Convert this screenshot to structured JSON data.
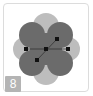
{
  "thumbnail": {
    "badge_number": "8",
    "shape_icon": "quatrefoil-shape-icon",
    "colors": {
      "lobe_dark": "#6b6b6b",
      "lobe_light": "#bdbdbd",
      "handle": "#111111",
      "badge_bg": "#b4b4b4",
      "border": "#dcdcdc"
    }
  }
}
